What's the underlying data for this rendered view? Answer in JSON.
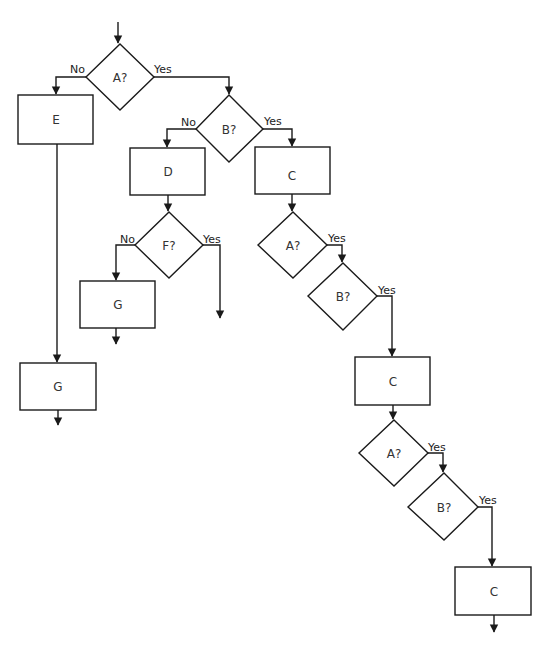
{
  "diagram": {
    "type": "flowchart",
    "colors": {
      "stroke": "#1a1a1a",
      "fill": "#ffffff",
      "text": "#333333"
    },
    "nodes": [
      {
        "id": "A1",
        "shape": "decision",
        "label": "A?"
      },
      {
        "id": "E",
        "shape": "process",
        "label": "E"
      },
      {
        "id": "B1",
        "shape": "decision",
        "label": "B?"
      },
      {
        "id": "D",
        "shape": "process",
        "label": "D"
      },
      {
        "id": "C1",
        "shape": "process",
        "label": "C"
      },
      {
        "id": "F",
        "shape": "decision",
        "label": "F?"
      },
      {
        "id": "G1",
        "shape": "process",
        "label": "G"
      },
      {
        "id": "G2",
        "shape": "process",
        "label": "G"
      },
      {
        "id": "A2",
        "shape": "decision",
        "label": "A?"
      },
      {
        "id": "B2",
        "shape": "decision",
        "label": "B?"
      },
      {
        "id": "C2",
        "shape": "process",
        "label": "C"
      },
      {
        "id": "A3",
        "shape": "decision",
        "label": "A?"
      },
      {
        "id": "B3",
        "shape": "decision",
        "label": "B?"
      },
      {
        "id": "C3",
        "shape": "process",
        "label": "C"
      }
    ],
    "edges": [
      {
        "from": "start",
        "to": "A1",
        "label": ""
      },
      {
        "from": "A1",
        "to": "E",
        "label": "No"
      },
      {
        "from": "A1",
        "to": "B1",
        "label": "Yes"
      },
      {
        "from": "B1",
        "to": "D",
        "label": "No"
      },
      {
        "from": "B1",
        "to": "C1",
        "label": "Yes"
      },
      {
        "from": "D",
        "to": "F",
        "label": ""
      },
      {
        "from": "F",
        "to": "G1",
        "label": "No"
      },
      {
        "from": "F",
        "to": "exit",
        "label": "Yes"
      },
      {
        "from": "E",
        "to": "G2",
        "label": ""
      },
      {
        "from": "G1",
        "to": "exit",
        "label": ""
      },
      {
        "from": "G2",
        "to": "exit",
        "label": ""
      },
      {
        "from": "C1",
        "to": "A2",
        "label": ""
      },
      {
        "from": "A2",
        "to": "B2",
        "label": "Yes"
      },
      {
        "from": "B2",
        "to": "C2",
        "label": "Yes"
      },
      {
        "from": "C2",
        "to": "A3",
        "label": ""
      },
      {
        "from": "A3",
        "to": "B3",
        "label": "Yes"
      },
      {
        "from": "B3",
        "to": "C3",
        "label": "Yes"
      },
      {
        "from": "C3",
        "to": "exit",
        "label": ""
      }
    ],
    "edge_labels": {
      "a1_no": "No",
      "a1_yes": "Yes",
      "b1_no": "No",
      "b1_yes": "Yes",
      "f_no": "No",
      "f_yes": "Yes",
      "a2_yes": "Yes",
      "b2_yes": "Yes",
      "a3_yes": "Yes",
      "b3_yes": "Yes"
    }
  }
}
